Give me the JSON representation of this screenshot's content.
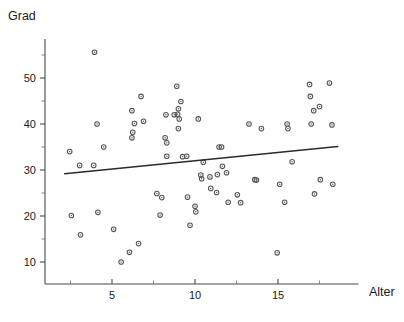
{
  "chart_data": {
    "type": "scatter",
    "title": "",
    "subtitle": "",
    "xlabel": "Alter",
    "ylabel": "Grad",
    "xlim": [
      1.8,
      19.0
    ],
    "ylim": [
      7.0,
      58.5
    ],
    "xticks_major": [
      5,
      10,
      15
    ],
    "xticks_major_labels": [
      "5",
      "10",
      "15"
    ],
    "xticks_minor": [
      2.5,
      7.5,
      12.5,
      17.5
    ],
    "yticks_major": [
      10,
      20,
      30,
      40,
      50
    ],
    "yticks_major_labels": [
      "10",
      "20",
      "30",
      "40",
      "50"
    ],
    "yticks_minor": [
      15,
      25,
      35,
      45,
      55
    ],
    "grid": false,
    "legend": false,
    "marker": "open-circle",
    "marker_color": "#555555",
    "line_color": "#2b2b2b",
    "trendline": {
      "label": "regression-line",
      "x_start": 2.15,
      "y_start": 29.2,
      "x_end": 18.6,
      "y_end": 35.1
    },
    "points": [
      {
        "x": 2.45,
        "y": 34.0
      },
      {
        "x": 2.55,
        "y": 20.1
      },
      {
        "x": 3.05,
        "y": 31.0
      },
      {
        "x": 3.1,
        "y": 15.9
      },
      {
        "x": 3.95,
        "y": 55.6
      },
      {
        "x": 3.9,
        "y": 31.0
      },
      {
        "x": 4.1,
        "y": 40.0
      },
      {
        "x": 4.15,
        "y": 20.8
      },
      {
        "x": 4.5,
        "y": 35.0
      },
      {
        "x": 5.1,
        "y": 17.1
      },
      {
        "x": 5.55,
        "y": 10.0
      },
      {
        "x": 6.05,
        "y": 12.1
      },
      {
        "x": 6.2,
        "y": 42.9
      },
      {
        "x": 6.25,
        "y": 38.2
      },
      {
        "x": 6.2,
        "y": 37.0
      },
      {
        "x": 6.35,
        "y": 40.1
      },
      {
        "x": 6.6,
        "y": 14.0
      },
      {
        "x": 6.75,
        "y": 46.0
      },
      {
        "x": 6.9,
        "y": 40.6
      },
      {
        "x": 7.7,
        "y": 24.9
      },
      {
        "x": 7.9,
        "y": 20.2
      },
      {
        "x": 8.0,
        "y": 24.0
      },
      {
        "x": 8.2,
        "y": 37.0
      },
      {
        "x": 8.3,
        "y": 35.9
      },
      {
        "x": 8.25,
        "y": 42.0
      },
      {
        "x": 8.3,
        "y": 33.0
      },
      {
        "x": 8.75,
        "y": 42.0
      },
      {
        "x": 8.95,
        "y": 42.1
      },
      {
        "x": 8.9,
        "y": 48.2
      },
      {
        "x": 9.0,
        "y": 43.3
      },
      {
        "x": 9.05,
        "y": 41.1
      },
      {
        "x": 9.0,
        "y": 39.0
      },
      {
        "x": 9.15,
        "y": 44.9
      },
      {
        "x": 9.25,
        "y": 32.9
      },
      {
        "x": 9.5,
        "y": 33.0
      },
      {
        "x": 9.55,
        "y": 24.1
      },
      {
        "x": 9.7,
        "y": 18.0
      },
      {
        "x": 10.0,
        "y": 22.1
      },
      {
        "x": 10.05,
        "y": 20.9
      },
      {
        "x": 10.2,
        "y": 41.1
      },
      {
        "x": 10.35,
        "y": 28.9
      },
      {
        "x": 10.4,
        "y": 28.1
      },
      {
        "x": 10.5,
        "y": 31.7
      },
      {
        "x": 10.9,
        "y": 28.5
      },
      {
        "x": 10.95,
        "y": 26.0
      },
      {
        "x": 11.35,
        "y": 29.0
      },
      {
        "x": 11.3,
        "y": 25.1
      },
      {
        "x": 11.45,
        "y": 35.0
      },
      {
        "x": 11.6,
        "y": 35.0
      },
      {
        "x": 11.65,
        "y": 30.8
      },
      {
        "x": 11.9,
        "y": 29.4
      },
      {
        "x": 12.0,
        "y": 23.0
      },
      {
        "x": 12.55,
        "y": 24.6
      },
      {
        "x": 12.75,
        "y": 22.9
      },
      {
        "x": 13.25,
        "y": 40.0
      },
      {
        "x": 13.6,
        "y": 27.9
      },
      {
        "x": 13.7,
        "y": 27.8
      },
      {
        "x": 14.0,
        "y": 39.0
      },
      {
        "x": 14.95,
        "y": 12.0
      },
      {
        "x": 15.1,
        "y": 26.9
      },
      {
        "x": 15.4,
        "y": 23.0
      },
      {
        "x": 15.55,
        "y": 40.0
      },
      {
        "x": 15.6,
        "y": 39.0
      },
      {
        "x": 15.85,
        "y": 31.8
      },
      {
        "x": 16.9,
        "y": 48.6
      },
      {
        "x": 16.95,
        "y": 46.0
      },
      {
        "x": 17.0,
        "y": 40.0
      },
      {
        "x": 17.15,
        "y": 42.9
      },
      {
        "x": 17.2,
        "y": 24.8
      },
      {
        "x": 17.5,
        "y": 43.8
      },
      {
        "x": 17.55,
        "y": 27.9
      },
      {
        "x": 18.1,
        "y": 48.9
      },
      {
        "x": 18.25,
        "y": 39.8
      },
      {
        "x": 18.3,
        "y": 26.9
      }
    ]
  },
  "axes": {
    "x_axis_name": "Alter",
    "y_axis_name": "Grad"
  }
}
